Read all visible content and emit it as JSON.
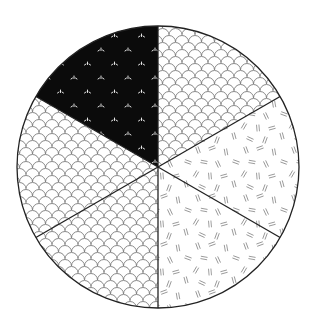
{
  "chart_data": {
    "type": "pie",
    "title": "",
    "start_angle_deg": 0,
    "direction": "clockwise",
    "labels_visible": false,
    "legend": "none",
    "center": [
      158,
      167
    ],
    "radius": 141,
    "slices": [
      {
        "index": 0,
        "value": 16.67,
        "pattern": "scales",
        "fill": "#ffffff",
        "ink": "#777777"
      },
      {
        "index": 1,
        "value": 16.67,
        "pattern": "dashes",
        "fill": "#ffffff",
        "ink": "#777777"
      },
      {
        "index": 2,
        "value": 16.67,
        "pattern": "dashes",
        "fill": "#ffffff",
        "ink": "#777777"
      },
      {
        "index": 3,
        "value": 16.67,
        "pattern": "scales",
        "fill": "#ffffff",
        "ink": "#777777"
      },
      {
        "index": 4,
        "value": 16.67,
        "pattern": "scales",
        "fill": "#ffffff",
        "ink": "#777777"
      },
      {
        "index": 5,
        "value": 16.67,
        "pattern": "sprouts",
        "fill": "#0b0b0b",
        "ink": "#ffffff"
      }
    ],
    "values": [
      16.67,
      16.67,
      16.67,
      16.67,
      16.67,
      16.67
    ],
    "categories": [
      "",
      "",
      "",
      "",
      "",
      ""
    ],
    "outline_color": "#222222"
  }
}
